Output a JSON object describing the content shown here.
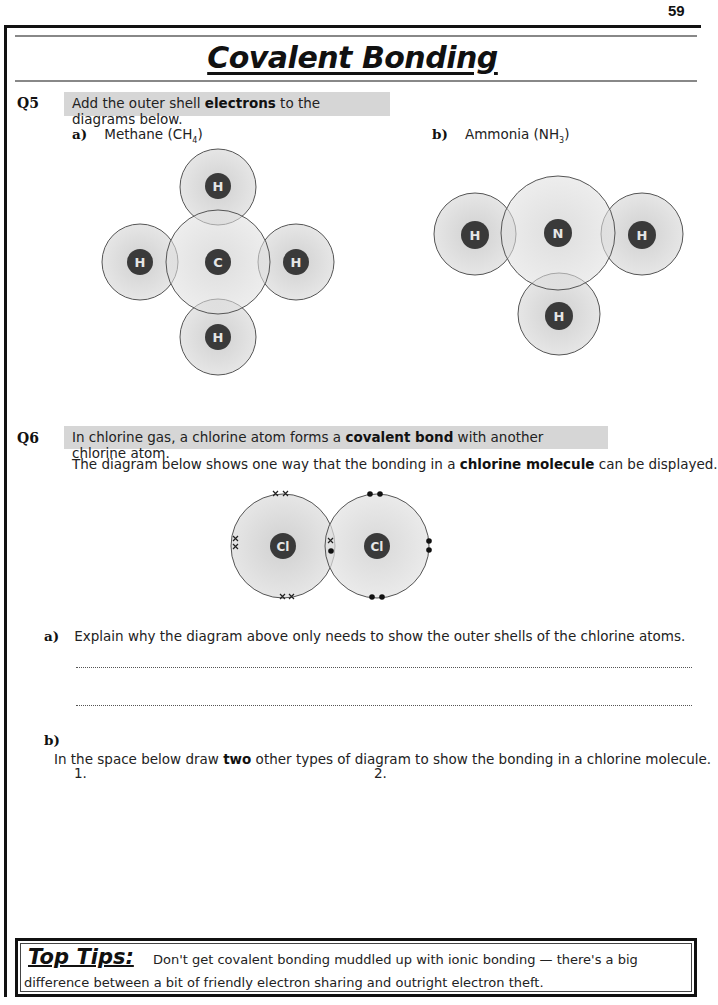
{
  "page": {
    "number": "59",
    "title": "Covalent Bonding"
  },
  "q5": {
    "label": "Q5",
    "instruction_pre": "Add the outer shell ",
    "instruction_bold": "electrons",
    "instruction_post": " to the diagrams below.",
    "part_a": {
      "label": "a)",
      "name": "Methane (CH",
      "sub": "4",
      "close": ")"
    },
    "part_b": {
      "label": "b)",
      "name": "Ammonia (NH",
      "sub": "3",
      "close": ")"
    },
    "methane_atoms": {
      "center": "C",
      "top": "H",
      "left": "H",
      "right": "H",
      "bottom": "H"
    },
    "ammonia_atoms": {
      "center": "N",
      "left": "H",
      "right": "H",
      "bottom": "H"
    }
  },
  "q6": {
    "label": "Q6",
    "intro_pre": "In chlorine gas, a chlorine atom forms a ",
    "intro_bold": "covalent bond",
    "intro_post": " with another chlorine atom.",
    "desc_pre": "The diagram below shows one way that the bonding in a ",
    "desc_bold": "chlorine molecule",
    "desc_post": " can be displayed.",
    "diagram_atoms": {
      "left": "Cl",
      "right": "Cl"
    },
    "part_a": {
      "label": "a)",
      "question": "Explain why the diagram above only needs to show the outer shells of the chlorine atoms.",
      "answer_line_1": "",
      "answer_line_2": ""
    },
    "part_b": {
      "label": "b)",
      "question_pre": "In the space below draw ",
      "question_bold": "two",
      "question_post": " other types of diagram to show the bonding in a chlorine molecule.",
      "slot_1": "1.",
      "slot_2": "2."
    }
  },
  "top_tips": {
    "title": "Top Tips:",
    "text_line_1": "Don't get covalent bonding muddled up with ionic bonding — there's a big",
    "text_line_2": "difference between a bit of friendly electron sharing and outright electron theft."
  },
  "colors": {
    "shell_fill": "#d9d9d9",
    "shell_stroke": "#555555",
    "nucleus": "#3a3a3a",
    "nucleus_text": "#e6e6e6",
    "highlight_band": "#d6d6d6"
  }
}
